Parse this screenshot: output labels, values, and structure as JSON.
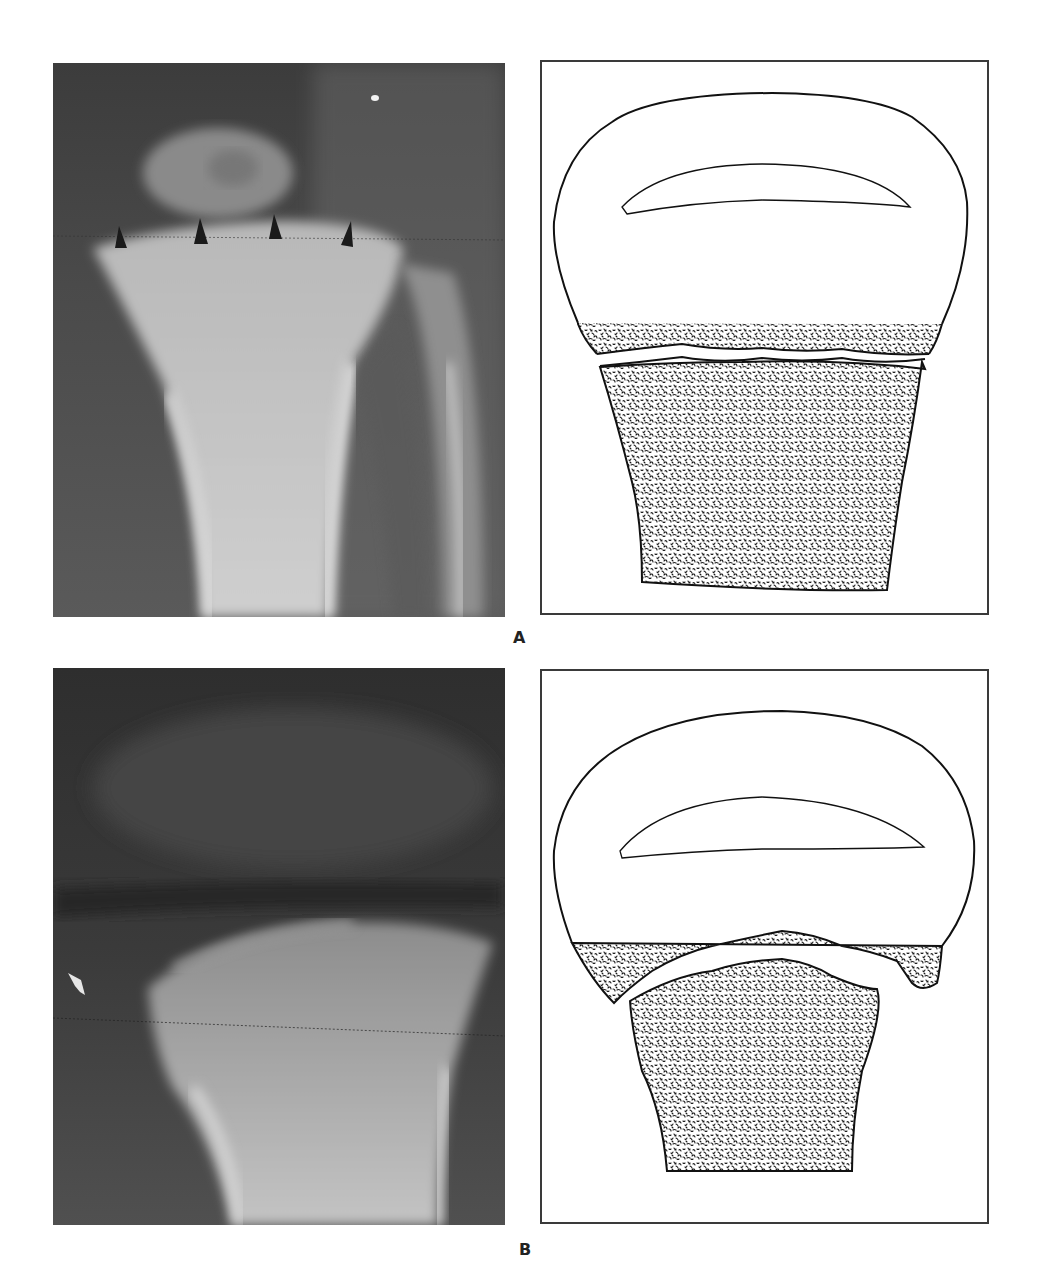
{
  "figure": {
    "panels": [
      {
        "id": "A",
        "label": "A",
        "radiograph": {
          "description": "Knee radiograph, proximal tibia with physis; four arrowheads mark the growth plate",
          "arrowheads": 4
        },
        "drawing": {
          "description": "Schematic of epiphysis with ossification center, physeal line slightly irregular, metaphysis stippled"
        }
      },
      {
        "id": "B",
        "label": "B",
        "radiograph": {
          "description": "Knee radiograph, proximal tibia with widened irregular physis; white arrow on left margin",
          "arrows": 1
        },
        "drawing": {
          "description": "Schematic of epiphysis with ossification center, physeal gap widened and displaced, metaphysis stippled"
        }
      }
    ],
    "colors": {
      "xray_dark": "#2a2a2a",
      "xray_bone": "#bdbdbd",
      "frame": "#3a3a3a",
      "stipple": "#1a1a1a"
    }
  }
}
